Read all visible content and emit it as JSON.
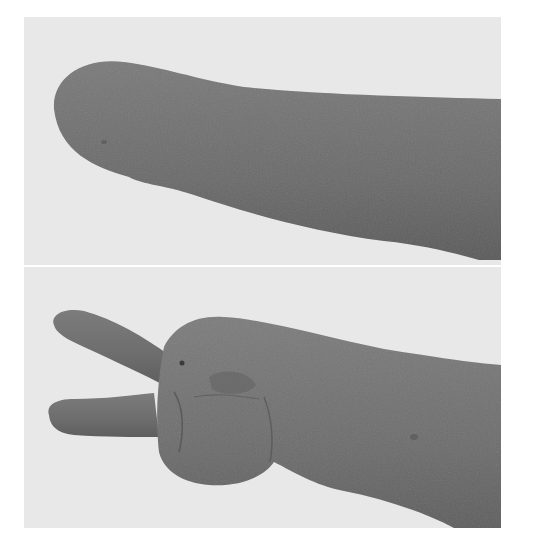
{
  "figure": {
    "panels": [
      {
        "id": "top",
        "subject": "residual-limb-forearm",
        "background_color": "#e6e6e6",
        "limb_color": "#6e6e6e"
      },
      {
        "id": "bottom",
        "subject": "hand-with-two-fingers",
        "background_color": "#e6e6e6",
        "limb_color": "#727272"
      }
    ],
    "caption_fragment": ""
  }
}
